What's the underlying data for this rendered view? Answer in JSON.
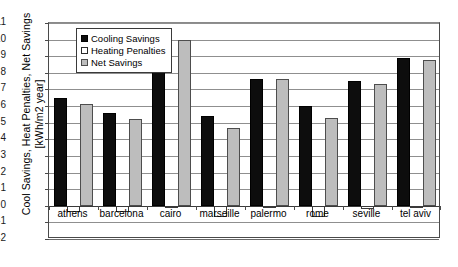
{
  "chart_data": {
    "type": "bar",
    "title": "",
    "xlabel": "",
    "ylabel": "Cool Savings, Heat Penalties, Net Savings [kWh/m2 year]",
    "ylabel_line1": "Cool Savings, Heat Penalties, Net Savings",
    "ylabel_line2": "[kWh/m2 year]",
    "categories": [
      "athens",
      "barcelona",
      "cairo",
      "marseille",
      "palermo",
      "rome",
      "seville",
      "tel aviv"
    ],
    "series": [
      {
        "name": "Cooling Savings",
        "color": "#0d0d0d",
        "values": [
          6.5,
          5.6,
          10.0,
          5.4,
          7.6,
          6.0,
          7.5,
          8.9
        ]
      },
      {
        "name": "Heating Penalties",
        "color": "#ffffff",
        "values": [
          -0.35,
          -0.4,
          -0.05,
          -0.7,
          -0.1,
          -0.7,
          -0.2,
          -0.15
        ]
      },
      {
        "name": "Net Savings",
        "color": "#bdbdbd",
        "values": [
          6.1,
          5.2,
          10.0,
          4.7,
          7.6,
          5.3,
          7.3,
          8.8
        ]
      }
    ],
    "ylim": [
      -2,
      11
    ],
    "ytick_labels": [
      "11",
      "10",
      "9",
      "8",
      "7",
      "6",
      "5",
      "4",
      "3",
      "2",
      "1",
      "0",
      "-1",
      "-2"
    ],
    "ytick_values": [
      11,
      10,
      9,
      8,
      7,
      6,
      5,
      4,
      3,
      2,
      1,
      0,
      -1,
      -2
    ],
    "grid": true,
    "legend_position": "top-left"
  }
}
